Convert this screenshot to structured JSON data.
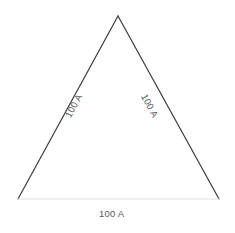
{
  "figure": {
    "type": "equilateral-triangle-diagram",
    "background_color": "#ffffff",
    "width": 235,
    "height": 233
  },
  "triangle": {
    "stroke_color_sides": "#3a3a3a",
    "stroke_color_base": "#e2e2e2",
    "stroke_width": 1.2,
    "fill": "none",
    "vertices": {
      "apex": {
        "x": 118,
        "y": 16
      },
      "bottom_left": {
        "x": 18,
        "y": 199
      },
      "bottom_right": {
        "x": 219,
        "y": 199
      }
    }
  },
  "labels": {
    "color": "#58595b",
    "left_side": "100 A",
    "right_side": "100 A",
    "bottom_side": "100 A"
  }
}
